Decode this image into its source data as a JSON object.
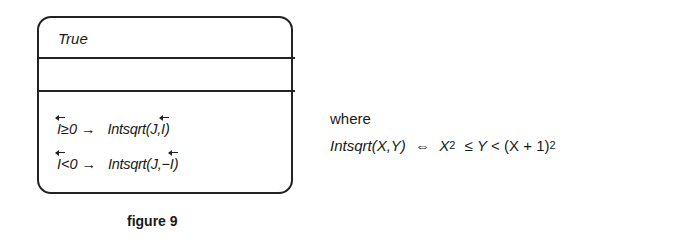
{
  "figure": {
    "caption": "figure 9",
    "box": {
      "guard": "True",
      "middle_section": "",
      "rules": [
        {
          "var": "I",
          "condition": "≥0",
          "arrow": "→",
          "action_prefix": "Intsqrt(J,",
          "action_var": "I",
          "action_suffix": ")"
        },
        {
          "var": "I",
          "condition": "<0",
          "arrow": "→",
          "action_prefix": "Intsqrt(J,−",
          "action_var": "I",
          "action_suffix": ")"
        }
      ]
    },
    "definition": {
      "label": "where",
      "lhs": "Intsqrt(X,Y)",
      "iff": "⇔",
      "x": "X",
      "exp1": "2",
      "leq": "≤",
      "y": "Y",
      "lt": "<",
      "rhs_base": "(X + 1)",
      "exp2": "2"
    }
  }
}
